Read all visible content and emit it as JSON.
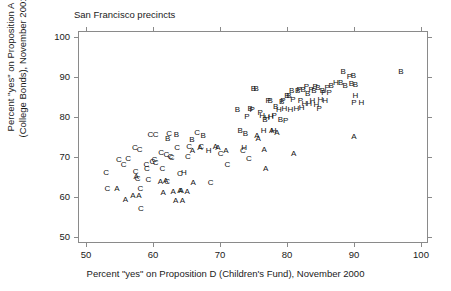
{
  "chart_data": {
    "type": "scatter",
    "title": "San Francisco precincts",
    "subtitle": "",
    "xlabel": "Percent \"yes\" on Proposition D (Children's Fund), November 2000",
    "ylabel_line1": "Percent \"yes\" on Proposition A",
    "ylabel_line2": "(College Bonds), November 2001",
    "xlim": [
      50,
      100
    ],
    "ylim": [
      50,
      100
    ],
    "xticks": [
      50,
      60,
      70,
      80,
      90,
      100
    ],
    "yticks": [
      50,
      60,
      70,
      80,
      90,
      100
    ],
    "xtick_labels": [
      "50",
      "60",
      "70",
      "80",
      "90",
      "100"
    ],
    "ytick_labels": [
      "50",
      "60",
      "70",
      "80",
      "90",
      "100"
    ],
    "grid": false,
    "legend_position": "none",
    "marker_style": "text-letter",
    "marker_note": "Each point is plotted as a letter code denoting the precinct's neighborhood/ethnic group classification",
    "legend_entries": [
      "A",
      "B",
      "C",
      "H",
      "P"
    ],
    "point_color": "#111111",
    "frame_color": "#8a8a8a",
    "points": [
      {
        "label": "C",
        "x": 53.0,
        "y": 66.1
      },
      {
        "label": "C",
        "x": 53.2,
        "y": 62.0
      },
      {
        "label": "A",
        "x": 54.6,
        "y": 62.0
      },
      {
        "label": "C",
        "x": 54.9,
        "y": 69.3
      },
      {
        "label": "C",
        "x": 55.6,
        "y": 68.1
      },
      {
        "label": "C",
        "x": 56.3,
        "y": 69.4
      },
      {
        "label": "A",
        "x": 55.9,
        "y": 59.3
      },
      {
        "label": "A",
        "x": 57.0,
        "y": 60.3
      },
      {
        "label": "C",
        "x": 57.3,
        "y": 72.2
      },
      {
        "label": "C",
        "x": 57.4,
        "y": 66.3
      },
      {
        "label": "A",
        "x": 57.5,
        "y": 64.9
      },
      {
        "label": "C",
        "x": 57.7,
        "y": 64.5
      },
      {
        "label": "A",
        "x": 57.9,
        "y": 60.3
      },
      {
        "label": "C",
        "x": 58.0,
        "y": 71.8
      },
      {
        "label": "C",
        "x": 58.1,
        "y": 62.0
      },
      {
        "label": "C",
        "x": 58.2,
        "y": 57.0
      },
      {
        "label": "C",
        "x": 59.0,
        "y": 68.0
      },
      {
        "label": "C",
        "x": 59.1,
        "y": 67.0
      },
      {
        "label": "C",
        "x": 59.3,
        "y": 64.2
      },
      {
        "label": "C",
        "x": 59.6,
        "y": 75.6
      },
      {
        "label": "C",
        "x": 59.9,
        "y": 68.8
      },
      {
        "label": "C",
        "x": 60.2,
        "y": 69.3
      },
      {
        "label": "C",
        "x": 60.4,
        "y": 68.6
      },
      {
        "label": "C",
        "x": 60.4,
        "y": 75.4
      },
      {
        "label": "A",
        "x": 61.1,
        "y": 63.8
      },
      {
        "label": "C",
        "x": 61.2,
        "y": 70.9
      },
      {
        "label": "C",
        "x": 61.4,
        "y": 66.9
      },
      {
        "label": "A",
        "x": 61.5,
        "y": 61.0
      },
      {
        "label": "C",
        "x": 62.0,
        "y": 70.5
      },
      {
        "label": "C",
        "x": 62.1,
        "y": 63.7
      },
      {
        "label": "A",
        "x": 61.9,
        "y": 64.1
      },
      {
        "label": "B",
        "x": 62.2,
        "y": 74.6
      },
      {
        "label": "C",
        "x": 62.4,
        "y": 75.7
      },
      {
        "label": "C",
        "x": 62.6,
        "y": 70.1
      },
      {
        "label": "C",
        "x": 62.8,
        "y": 69.8
      },
      {
        "label": "A",
        "x": 63.0,
        "y": 61.3
      },
      {
        "label": "A",
        "x": 63.4,
        "y": 59.1
      },
      {
        "label": "B",
        "x": 63.5,
        "y": 75.4
      },
      {
        "label": "C",
        "x": 63.6,
        "y": 72.3
      },
      {
        "label": "A",
        "x": 64.0,
        "y": 61.5
      },
      {
        "label": "A",
        "x": 64.2,
        "y": 61.4
      },
      {
        "label": "C",
        "x": 64.0,
        "y": 65.8
      },
      {
        "label": "A",
        "x": 64.4,
        "y": 59.0
      },
      {
        "label": "H",
        "x": 64.6,
        "y": 66.1
      },
      {
        "label": "A",
        "x": 65.1,
        "y": 61.3
      },
      {
        "label": "C",
        "x": 65.2,
        "y": 69.9
      },
      {
        "label": "C",
        "x": 65.4,
        "y": 72.5
      },
      {
        "label": "B",
        "x": 65.8,
        "y": 74.3
      },
      {
        "label": "A",
        "x": 65.9,
        "y": 71.6
      },
      {
        "label": "A",
        "x": 66.0,
        "y": 63.6
      },
      {
        "label": "C",
        "x": 66.6,
        "y": 75.9
      },
      {
        "label": "A",
        "x": 67.0,
        "y": 72.3
      },
      {
        "label": "C",
        "x": 67.2,
        "y": 72.4
      },
      {
        "label": "B",
        "x": 67.5,
        "y": 75.3
      },
      {
        "label": "H",
        "x": 68.3,
        "y": 71.6
      },
      {
        "label": "C",
        "x": 68.6,
        "y": 63.4
      },
      {
        "label": "A",
        "x": 69.3,
        "y": 72.4
      },
      {
        "label": "A",
        "x": 69.7,
        "y": 72.3
      },
      {
        "label": "C",
        "x": 70.1,
        "y": 70.7
      },
      {
        "label": "A",
        "x": 70.9,
        "y": 71.5
      },
      {
        "label": "C",
        "x": 71.1,
        "y": 68.0
      },
      {
        "label": "B",
        "x": 72.6,
        "y": 81.7
      },
      {
        "label": "B",
        "x": 73.0,
        "y": 76.6
      },
      {
        "label": "C",
        "x": 73.4,
        "y": 71.6
      },
      {
        "label": "H",
        "x": 73.6,
        "y": 72.3
      },
      {
        "label": "B",
        "x": 73.8,
        "y": 75.8
      },
      {
        "label": "P",
        "x": 74.0,
        "y": 80.0
      },
      {
        "label": "C",
        "x": 74.3,
        "y": 69.4
      },
      {
        "label": "B",
        "x": 74.5,
        "y": 82.0
      },
      {
        "label": "P",
        "x": 74.8,
        "y": 81.8
      },
      {
        "label": "B",
        "x": 75.0,
        "y": 86.9
      },
      {
        "label": "B",
        "x": 75.4,
        "y": 86.9
      },
      {
        "label": "A",
        "x": 75.5,
        "y": 75.2
      },
      {
        "label": "A",
        "x": 75.7,
        "y": 74.6
      },
      {
        "label": "P",
        "x": 76.0,
        "y": 81.1
      },
      {
        "label": "H",
        "x": 76.3,
        "y": 80.3
      },
      {
        "label": "H",
        "x": 76.5,
        "y": 76.6
      },
      {
        "label": "B",
        "x": 76.7,
        "y": 79.3
      },
      {
        "label": "A",
        "x": 76.6,
        "y": 71.7
      },
      {
        "label": "A",
        "x": 76.8,
        "y": 66.9
      },
      {
        "label": "H",
        "x": 77.0,
        "y": 79.8
      },
      {
        "label": "P",
        "x": 77.2,
        "y": 84.1
      },
      {
        "label": "B",
        "x": 77.5,
        "y": 84.1
      },
      {
        "label": "H",
        "x": 77.6,
        "y": 80.0
      },
      {
        "label": "A",
        "x": 77.7,
        "y": 76.4
      },
      {
        "label": "H",
        "x": 78.0,
        "y": 76.5
      },
      {
        "label": "P",
        "x": 78.1,
        "y": 80.2
      },
      {
        "label": "B",
        "x": 78.3,
        "y": 82.5
      },
      {
        "label": "A",
        "x": 78.5,
        "y": 76.1
      },
      {
        "label": "H",
        "x": 78.8,
        "y": 81.7
      },
      {
        "label": "B",
        "x": 79.0,
        "y": 79.2
      },
      {
        "label": "B",
        "x": 79.2,
        "y": 83.7
      },
      {
        "label": "P",
        "x": 79.4,
        "y": 83.9
      },
      {
        "label": "H",
        "x": 79.6,
        "y": 82.0
      },
      {
        "label": "P",
        "x": 79.8,
        "y": 79.0
      },
      {
        "label": "B",
        "x": 80.0,
        "y": 85.3
      },
      {
        "label": "B",
        "x": 80.3,
        "y": 85.2
      },
      {
        "label": "H",
        "x": 80.5,
        "y": 81.7
      },
      {
        "label": "B",
        "x": 80.7,
        "y": 86.4
      },
      {
        "label": "P",
        "x": 80.9,
        "y": 84.2
      },
      {
        "label": "A",
        "x": 81.0,
        "y": 70.8
      },
      {
        "label": "H",
        "x": 81.4,
        "y": 81.9
      },
      {
        "label": "B",
        "x": 81.6,
        "y": 86.6
      },
      {
        "label": "P",
        "x": 81.8,
        "y": 86.7
      },
      {
        "label": "P",
        "x": 82.0,
        "y": 84.0
      },
      {
        "label": "H",
        "x": 82.2,
        "y": 82.2
      },
      {
        "label": "B",
        "x": 82.4,
        "y": 86.8
      },
      {
        "label": "H",
        "x": 82.6,
        "y": 83.3
      },
      {
        "label": "P",
        "x": 82.9,
        "y": 87.4
      },
      {
        "label": "B",
        "x": 83.1,
        "y": 85.7
      },
      {
        "label": "H",
        "x": 83.3,
        "y": 83.2
      },
      {
        "label": "P",
        "x": 83.6,
        "y": 86.8
      },
      {
        "label": "H",
        "x": 83.8,
        "y": 84.0
      },
      {
        "label": "B",
        "x": 84.0,
        "y": 86.6
      },
      {
        "label": "P",
        "x": 84.2,
        "y": 87.5
      },
      {
        "label": "H",
        "x": 84.4,
        "y": 83.1
      },
      {
        "label": "B",
        "x": 84.6,
        "y": 87.3
      },
      {
        "label": "P",
        "x": 84.8,
        "y": 81.9
      },
      {
        "label": "H",
        "x": 85.0,
        "y": 84.2
      },
      {
        "label": "B",
        "x": 85.3,
        "y": 86.6
      },
      {
        "label": "P",
        "x": 85.5,
        "y": 86.0
      },
      {
        "label": "H",
        "x": 85.7,
        "y": 84.1
      },
      {
        "label": "P",
        "x": 86.0,
        "y": 87.2
      },
      {
        "label": "P",
        "x": 86.3,
        "y": 86.1
      },
      {
        "label": "B",
        "x": 86.6,
        "y": 87.8
      },
      {
        "label": "H",
        "x": 87.3,
        "y": 88.4
      },
      {
        "label": "B",
        "x": 88.0,
        "y": 88.4
      },
      {
        "label": "B",
        "x": 88.4,
        "y": 91.3
      },
      {
        "label": "B",
        "x": 88.7,
        "y": 87.7
      },
      {
        "label": "P",
        "x": 89.3,
        "y": 90.0
      },
      {
        "label": "B",
        "x": 89.9,
        "y": 90.3
      },
      {
        "label": "B",
        "x": 89.6,
        "y": 88.2
      },
      {
        "label": "B",
        "x": 90.2,
        "y": 87.9
      },
      {
        "label": "H",
        "x": 90.2,
        "y": 85.3
      },
      {
        "label": "P",
        "x": 90.0,
        "y": 83.6
      },
      {
        "label": "H",
        "x": 91.1,
        "y": 83.5
      },
      {
        "label": "A",
        "x": 90.0,
        "y": 75.0
      },
      {
        "label": "B",
        "x": 97.0,
        "y": 91.2
      }
    ]
  }
}
